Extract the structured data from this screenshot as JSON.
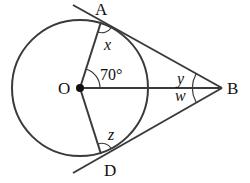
{
  "diagram": {
    "points": {
      "O": {
        "label": "O",
        "x": 80,
        "y": 88
      },
      "A": {
        "label": "A",
        "x": 101,
        "y": 22
      },
      "D": {
        "label": "D",
        "x": 101,
        "y": 154
      },
      "B": {
        "label": "B",
        "x": 222,
        "y": 88
      }
    },
    "circle": {
      "center": "O",
      "radius": 68
    },
    "angles": {
      "x": {
        "label": "x",
        "at": "A"
      },
      "angle_AOB": {
        "label": "70°",
        "at": "O"
      },
      "y": {
        "label": "y",
        "at": "B"
      },
      "w": {
        "label": "w",
        "at": "B"
      },
      "z": {
        "label": "z",
        "at": "D"
      }
    },
    "segments": [
      "OA",
      "OD",
      "OB",
      "BA (tangent)",
      "BD (tangent)"
    ],
    "colors": {
      "line": "#3a3a3a",
      "text": "#111111",
      "background": "#ffffff"
    }
  }
}
